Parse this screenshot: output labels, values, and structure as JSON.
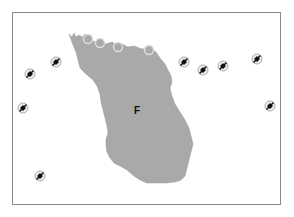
{
  "map": {
    "region_label": "F",
    "region_label_pos": {
      "x": 137,
      "y": 110
    },
    "land_color": "#a9a9a9",
    "frame_color": "#8a8a8a",
    "markers": [
      {
        "type": "plane",
        "x": 30,
        "y": 74
      },
      {
        "type": "plane",
        "x": 56,
        "y": 62
      },
      {
        "type": "plane",
        "x": 23,
        "y": 108
      },
      {
        "type": "plane",
        "x": 40,
        "y": 176
      },
      {
        "type": "plane",
        "x": 184,
        "y": 62
      },
      {
        "type": "plane",
        "x": 203,
        "y": 70
      },
      {
        "type": "plane",
        "x": 223,
        "y": 66
      },
      {
        "type": "plane",
        "x": 257,
        "y": 59
      },
      {
        "type": "plane",
        "x": 270,
        "y": 106
      }
    ],
    "coastal_rings": [
      {
        "x": 88,
        "y": 39
      },
      {
        "x": 100,
        "y": 43
      },
      {
        "x": 118,
        "y": 47
      },
      {
        "x": 149,
        "y": 50
      }
    ]
  }
}
